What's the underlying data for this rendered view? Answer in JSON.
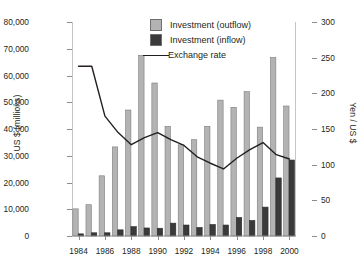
{
  "chart_data": {
    "type": "bar",
    "title": "",
    "xlabel": "",
    "ylabel": "US $ (millions)",
    "ylabel_right": "Yen / US $",
    "ylim": [
      0,
      80000
    ],
    "ylim_right": [
      0,
      300
    ],
    "grid": false,
    "legend_position": "top-center",
    "categories": [
      1984,
      1985,
      1986,
      1987,
      1988,
      1989,
      1990,
      1991,
      1992,
      1993,
      1994,
      1995,
      1996,
      1997,
      1998,
      1999,
      2000
    ],
    "x_tick_labels": [
      "1984",
      "1986",
      "1988",
      "1990",
      "1992",
      "1994",
      "1996",
      "1998",
      "2000"
    ],
    "x_tick_values": [
      1984,
      1986,
      1988,
      1990,
      1992,
      1994,
      1996,
      1998,
      2000
    ],
    "y_tick_labels": [
      "0",
      "10,000",
      "20,000",
      "30,000",
      "40,000",
      "50,000",
      "60,000",
      "70,000",
      "80,000"
    ],
    "y_tick_values": [
      0,
      10000,
      20000,
      30000,
      40000,
      50000,
      60000,
      70000,
      80000
    ],
    "y_tick_labels_right": [
      "0",
      "50",
      "100",
      "150",
      "200",
      "250",
      "300"
    ],
    "y_tick_values_right": [
      0,
      50,
      100,
      150,
      200,
      250,
      300
    ],
    "series": [
      {
        "name": "Investment (outflow)",
        "kind": "bar",
        "color": "#b3b3b3",
        "axis": "left",
        "values": [
          10150,
          11700,
          22500,
          33300,
          47100,
          67500,
          57200,
          41000,
          34100,
          36000,
          41000,
          50800,
          48100,
          54000,
          40700,
          66700,
          48600
        ]
      },
      {
        "name": "Investment (inflow)",
        "kind": "bar",
        "color": "#3a3a3a",
        "axis": "left",
        "values": [
          800,
          1200,
          1200,
          2300,
          3500,
          3000,
          2900,
          4800,
          4100,
          3200,
          4300,
          4100,
          6900,
          5800,
          10800,
          21700,
          28400
        ]
      },
      {
        "name": "Exchange rate",
        "kind": "line",
        "color": "#231f20",
        "axis": "right",
        "values": [
          238,
          238,
          168,
          145,
          128,
          138,
          145,
          135,
          127,
          111,
          102,
          94,
          109,
          121,
          131,
          114,
          108
        ]
      }
    ],
    "legend_entries": [
      {
        "label": "Investment (outflow)",
        "marker": "square",
        "color": "#b3b3b3"
      },
      {
        "label": "Investment (inflow)",
        "marker": "square",
        "color": "#3a3a3a"
      },
      {
        "label": "Exchange rate",
        "marker": "line",
        "color": "#231f20"
      }
    ]
  },
  "colors": {
    "outflow": "#b3b3b3",
    "inflow": "#3a3a3a",
    "line": "#231f20",
    "axis": "#8a8c8e",
    "text": "#231f20",
    "background": "#ffffff"
  }
}
